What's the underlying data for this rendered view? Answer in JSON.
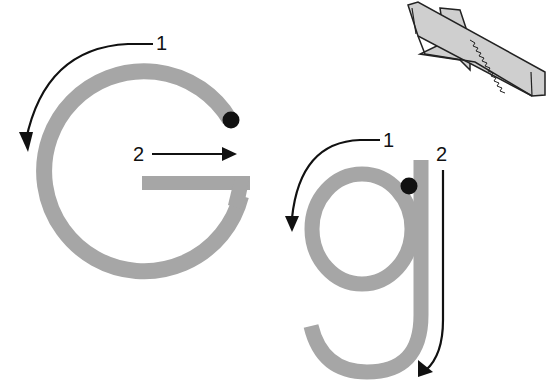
{
  "worksheet": {
    "letter_upper": "G",
    "letter_lower": "g",
    "colors": {
      "letter_stroke": "#a6a6a6",
      "ink": "#111111",
      "knife_fill": "#cfcfcf",
      "background": "#ffffff"
    },
    "upper": {
      "stroke_1_label": "1",
      "stroke_2_label": "2"
    },
    "lower": {
      "stroke_1_label": "1",
      "stroke_2_label": "2"
    },
    "picture": "knife-icon"
  }
}
